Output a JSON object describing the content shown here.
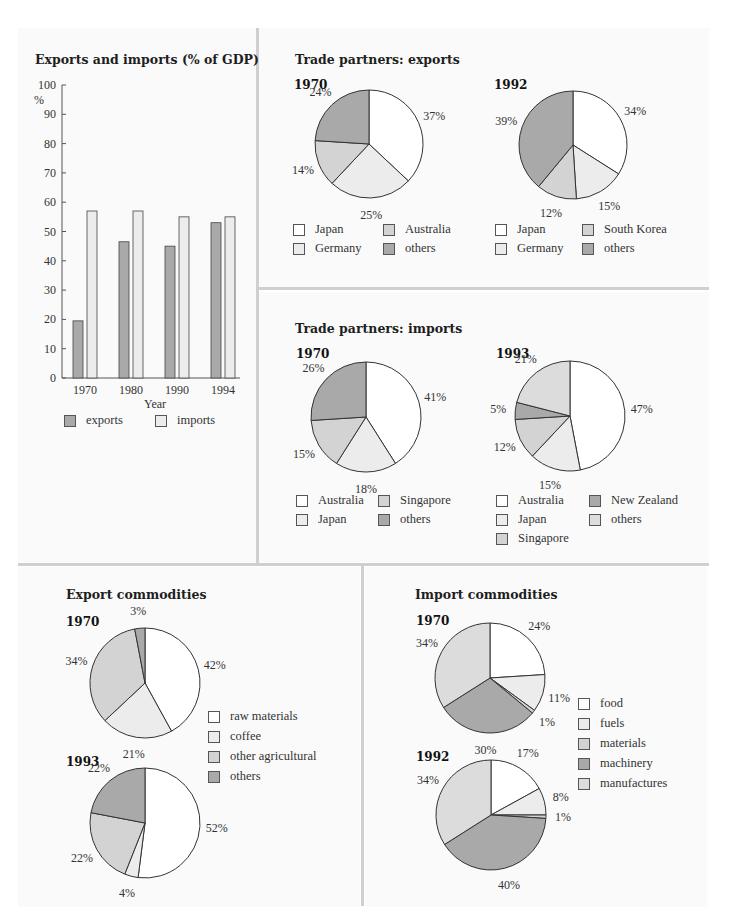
{
  "colors": {
    "white": "#ffffff",
    "very_light": "#ececec",
    "light": "#d3d3d3",
    "dark": "#a9a9a9",
    "outline": "#333333"
  },
  "chart_data": [
    {
      "id": "exports_imports_gdp",
      "type": "bar",
      "title": "Exports and imports (% of GDP)",
      "xlabel": "Year",
      "ylabel": "%",
      "ylim": [
        0,
        100
      ],
      "yticks": [
        0,
        10,
        20,
        30,
        40,
        50,
        60,
        70,
        80,
        90,
        100
      ],
      "categories": [
        "1970",
        "1980",
        "1990",
        "1994"
      ],
      "series": [
        {
          "name": "exports",
          "color": "#a9a9a9",
          "values": [
            19.5,
            46.5,
            45,
            53
          ]
        },
        {
          "name": "imports",
          "color": "#ececec",
          "values": [
            57,
            57,
            55,
            55
          ]
        }
      ],
      "legend_position": "bottom",
      "grid": false
    },
    {
      "id": "trade_partners_exports",
      "type": "pie",
      "title": "Trade partners: exports",
      "pies": [
        {
          "year": "1970",
          "slices": [
            {
              "label": "Japan",
              "value": 37,
              "color": "#ffffff"
            },
            {
              "label": "Germany",
              "value": 25,
              "color": "#ececec"
            },
            {
              "label": "Australia",
              "value": 14,
              "color": "#d3d3d3"
            },
            {
              "label": "others",
              "value": 24,
              "color": "#a9a9a9"
            }
          ]
        },
        {
          "year": "1992",
          "slices": [
            {
              "label": "Japan",
              "value": 34,
              "color": "#ffffff"
            },
            {
              "label": "Germany",
              "value": 15,
              "color": "#ececec"
            },
            {
              "label": "South Korea",
              "value": 12,
              "color": "#d3d3d3"
            },
            {
              "label": "others",
              "value": 39,
              "color": "#a9a9a9"
            }
          ]
        }
      ]
    },
    {
      "id": "trade_partners_imports",
      "type": "pie",
      "title": "Trade partners: imports",
      "pies": [
        {
          "year": "1970",
          "slices": [
            {
              "label": "Australia",
              "value": 41,
              "color": "#ffffff"
            },
            {
              "label": "Japan",
              "value": 18,
              "color": "#ececec"
            },
            {
              "label": "Singapore",
              "value": 15,
              "color": "#d3d3d3"
            },
            {
              "label": "others",
              "value": 26,
              "color": "#a9a9a9"
            }
          ]
        },
        {
          "year": "1993",
          "slices": [
            {
              "label": "Australia",
              "value": 47,
              "color": "#ffffff"
            },
            {
              "label": "Japan",
              "value": 15,
              "color": "#ececec"
            },
            {
              "label": "Singapore",
              "value": 12,
              "color": "#d3d3d3"
            },
            {
              "label": "New Zealand",
              "value": 5,
              "color": "#a9a9a9"
            },
            {
              "label": "others",
              "value": 21,
              "color": "#dcdcdc"
            }
          ]
        }
      ]
    },
    {
      "id": "export_commodities",
      "type": "pie",
      "title": "Export commodities",
      "pies": [
        {
          "year": "1970",
          "slices": [
            {
              "label": "raw materials",
              "value": 42,
              "color": "#ffffff"
            },
            {
              "label": "coffee",
              "value": 21,
              "color": "#ececec"
            },
            {
              "label": "other agricultural",
              "value": 34,
              "color": "#d3d3d3"
            },
            {
              "label": "others",
              "value": 3,
              "color": "#a9a9a9"
            }
          ]
        },
        {
          "year": "1993",
          "slices": [
            {
              "label": "raw materials",
              "value": 52,
              "color": "#ffffff"
            },
            {
              "label": "coffee",
              "value": 4,
              "color": "#ececec"
            },
            {
              "label": "other agricultural",
              "value": 22,
              "color": "#d3d3d3"
            },
            {
              "label": "others",
              "value": 22,
              "color": "#a9a9a9"
            }
          ]
        }
      ]
    },
    {
      "id": "import_commodities",
      "type": "pie",
      "title": "Import commodities",
      "pies": [
        {
          "year": "1970",
          "slices": [
            {
              "label": "food",
              "value": 24,
              "color": "#ffffff"
            },
            {
              "label": "fuels",
              "value": 11,
              "color": "#ececec"
            },
            {
              "label": "materials",
              "value": 1,
              "color": "#d3d3d3"
            },
            {
              "label": "machinery",
              "value": 30,
              "color": "#a9a9a9"
            },
            {
              "label": "manufactures",
              "value": 34,
              "color": "#dcdcdc"
            }
          ]
        },
        {
          "year": "1992",
          "slices": [
            {
              "label": "food",
              "value": 17,
              "color": "#ffffff"
            },
            {
              "label": "fuels",
              "value": 8,
              "color": "#ececec"
            },
            {
              "label": "materials",
              "value": 1,
              "color": "#d3d3d3"
            },
            {
              "label": "machinery",
              "value": 40,
              "color": "#a9a9a9"
            },
            {
              "label": "manufactures",
              "value": 34,
              "color": "#dcdcdc"
            }
          ]
        }
      ]
    }
  ],
  "panels": {
    "gdp": {
      "title": "Exports and imports (% of GDP)",
      "ylabel": "%",
      "xlabel": "Year",
      "legend": [
        "exports",
        "imports"
      ]
    },
    "exp_partners": {
      "title": "Trade partners: exports",
      "year_a": "1970",
      "year_b": "1992",
      "legend_a": [
        "Japan",
        "Australia",
        "Germany",
        "others"
      ],
      "legend_b": [
        "Japan",
        "South Korea",
        "Germany",
        "others"
      ]
    },
    "imp_partners": {
      "title": "Trade partners: imports",
      "year_a": "1970",
      "year_b": "1993",
      "legend_a": [
        "Australia",
        "Singapore",
        "Japan",
        "others"
      ],
      "legend_b": [
        "Australia",
        "New Zealand",
        "Japan",
        "others",
        "Singapore"
      ]
    },
    "exp_comm": {
      "title": "Export commodities",
      "year_a": "1970",
      "year_b": "1993",
      "legend": [
        "raw materials",
        "coffee",
        "other agricultural",
        "others"
      ]
    },
    "imp_comm": {
      "title": "Import commodities",
      "year_a": "1970",
      "year_b": "1992",
      "legend": [
        "food",
        "fuels",
        "materials",
        "machinery",
        "manufactures"
      ]
    }
  }
}
